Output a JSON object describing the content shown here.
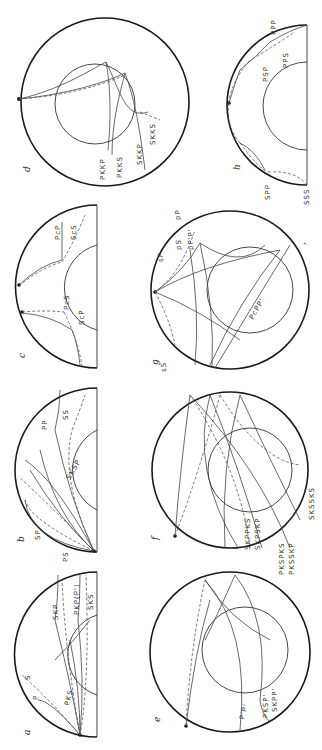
{
  "figure": {
    "orientation": "rotated-90-cw",
    "panels": [
      {
        "id": "a",
        "label": "a",
        "phases": [
          "P",
          "S",
          "PKS",
          "SKP",
          "PKP(P')",
          "SKS"
        ]
      },
      {
        "id": "b",
        "label": "b",
        "phases": [
          "PS",
          "SP",
          "SKSP",
          "PP",
          "SS"
        ]
      },
      {
        "id": "c",
        "label": "c",
        "phases": [
          "PcS",
          "ScP",
          "PcP",
          "ScS"
        ]
      },
      {
        "id": "d",
        "label": "d",
        "phases": [
          "PKKP",
          "PKKS",
          "SKKP",
          "SKKS"
        ]
      },
      {
        "id": "e",
        "label": "e",
        "phases": [
          "P'P'",
          "PKSP'",
          "SKPP'"
        ]
      },
      {
        "id": "f",
        "label": "f",
        "phases": [
          "SKPPKS",
          "SKPSKP",
          "PKSPKS",
          "PKSSKP",
          "SKSSKS"
        ]
      },
      {
        "id": "g",
        "label": "g",
        "phases": [
          "sS",
          "sP",
          "pP",
          "pS",
          "pP'P'",
          "PcPP'"
        ]
      },
      {
        "id": "h",
        "label": "h",
        "phases": [
          "SSS",
          "SPP",
          "PSP",
          "PPS",
          "PPP"
        ]
      }
    ]
  },
  "labels": {
    "a": {
      "p": "P",
      "s": "S",
      "pks": "PKS",
      "skp": "SKP",
      "pkp": "PKP(P')",
      "sks": "SKS"
    },
    "b": {
      "ps": "PS",
      "sp": "SP",
      "sksp": "SKSP",
      "pp": "PP",
      "ss": "SS"
    },
    "c": {
      "pcs": "PcS",
      "scp": "ScP",
      "pcp": "PcP",
      "scs": "ScS"
    },
    "d": {
      "pkkp": "PKKP",
      "pkks": "PKKS",
      "skkp": "SKKP",
      "skks": "SKKS"
    },
    "e": {
      "pp": "P'P'",
      "pksp": "PKSP'",
      "skpp": "SKPP'"
    },
    "f": {
      "skppks": "SKPPKS",
      "skpskp": "SKPSKP",
      "pkspks": "PKSPKS",
      "pksskp": "PKSSKP",
      "sksSks": "SKSSKS"
    },
    "g": {
      "ss": "sS",
      "sp": "sP",
      "pp": "pP",
      "ps": "pS",
      "pppp": "pP'P'",
      "pcpp": "PcPP'"
    },
    "h": {
      "sss": "SSS",
      "spp": "SPP",
      "psp": "PSP",
      "pps": "PPS",
      "ppp": "PPP"
    }
  }
}
